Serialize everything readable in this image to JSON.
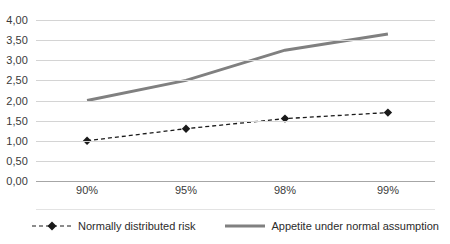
{
  "chart_data": {
    "type": "line",
    "title": "",
    "subtitle": "",
    "xlabel": "",
    "ylabel": "",
    "categories": [
      "90%",
      "95%",
      "98%",
      "99%"
    ],
    "x_positions_pct": [
      12.8,
      37.6,
      62.4,
      88.2
    ],
    "ylim": [
      0.0,
      4.0
    ],
    "ytick_labels": [
      "0,00",
      "0,50",
      "1,00",
      "1,50",
      "2,00",
      "2,50",
      "3,00",
      "3,50",
      "4,00"
    ],
    "ytick_values": [
      0.0,
      0.5,
      1.0,
      1.5,
      2.0,
      2.5,
      3.0,
      3.5,
      4.0
    ],
    "grid": true,
    "legend_position": "bottom",
    "series": [
      {
        "name": "Normally distributed risk",
        "values": [
          1.0,
          1.3,
          1.55,
          1.7
        ],
        "style": "dashed",
        "marker": "diamond",
        "color": "#1a1a1a"
      },
      {
        "name": "Appetite under normal assumption",
        "values": [
          2.0,
          2.5,
          3.25,
          3.65
        ],
        "style": "solid",
        "marker": "none",
        "color": "#808080"
      }
    ]
  },
  "legend": {
    "items": [
      {
        "label": "Normally distributed risk",
        "swatch": "dashed-diamond-swatch"
      },
      {
        "label": "Appetite under normal assumption",
        "swatch": "solid-line-swatch"
      }
    ]
  },
  "colors": {
    "series_dashed": "#1a1a1a",
    "series_solid": "#808080",
    "gridline": "#d4d4d4",
    "baseline": "#a6a6a6",
    "text": "#3a3a3a"
  }
}
